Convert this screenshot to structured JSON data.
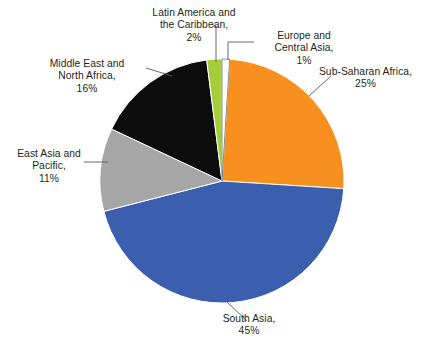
{
  "chart_data": {
    "type": "pie",
    "title": "",
    "subtitle": "",
    "xlabel": "",
    "ylabel": "",
    "legend_position": "none",
    "labels_position": "outside-with-leader-lines",
    "grid": false,
    "start_angle_deg": 0,
    "direction": "clockwise",
    "units": "percent",
    "categories": [
      "Europe and Central Asia",
      "Sub-Saharan Africa",
      "South Asia",
      "East Asia and Pacific",
      "Middle East and North Africa",
      "Latin America and the Caribbean"
    ],
    "values": [
      1,
      25,
      45,
      11,
      16,
      2
    ],
    "colors": [
      "#fdfdfd",
      "#f7901e",
      "#3b5eae",
      "#a6a6a6",
      "#0d0d0d",
      "#a4ce39"
    ],
    "slices": [
      {
        "name": "europe-central-asia",
        "label_line1": "Europe and",
        "label_line2": "Central Asia,",
        "label_line3": "1%",
        "value": 1,
        "value_text": "1%",
        "color": "#fdfdfd"
      },
      {
        "name": "sub-saharan-africa",
        "label_line1": "Sub-Saharan Africa,",
        "label_line2": "25%",
        "label_line3": "",
        "value": 25,
        "value_text": "25%",
        "color": "#f7901e"
      },
      {
        "name": "south-asia",
        "label_line1": "South Asia,",
        "label_line2": "45%",
        "label_line3": "",
        "value": 45,
        "value_text": "45%",
        "color": "#3b5eae"
      },
      {
        "name": "east-asia-pacific",
        "label_line1": "East Asia and",
        "label_line2": "Pacific,",
        "label_line3": "11%",
        "value": 11,
        "value_text": "11%",
        "color": "#a6a6a6"
      },
      {
        "name": "middle-east-north-africa",
        "label_line1": "Middle East and",
        "label_line2": "North Africa,",
        "label_line3": "16%",
        "value": 16,
        "value_text": "16%",
        "color": "#0d0d0d"
      },
      {
        "name": "latin-america-caribbean",
        "label_line1": "Latin America and",
        "label_line2": "the Caribbean,",
        "label_line3": "2%",
        "value": 2,
        "value_text": "2%",
        "color": "#a4ce39"
      }
    ]
  },
  "geometry": {
    "center_x": 222,
    "center_y": 181,
    "radius": 122
  },
  "style": {
    "background": "#ffffff",
    "text_color": "#231f20",
    "leader_line_color": "#58595b"
  }
}
